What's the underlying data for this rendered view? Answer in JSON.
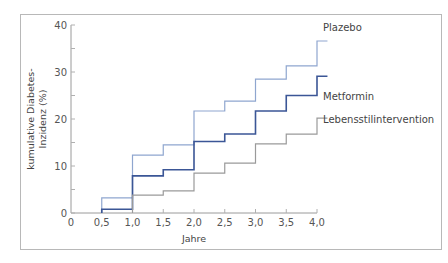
{
  "chart_data": {
    "type": "line",
    "step": true,
    "title": "",
    "xlabel": "Jahre",
    "ylabel_lines": [
      "kumulative Diabetes-",
      "Inzidenz (%)"
    ],
    "ylabel": "kumulative Diabetes-Inzidenz (%)",
    "xlim": [
      0,
      4.0
    ],
    "ylim": [
      0,
      40
    ],
    "x_ticks": [
      0,
      0.5,
      1.0,
      1.5,
      2.0,
      2.5,
      3.0,
      3.5,
      4.0
    ],
    "x_tick_labels": [
      "0",
      "0,5",
      "1,0",
      "1,5",
      "2,0",
      "2,5",
      "3,0",
      "3,5",
      "4,0"
    ],
    "y_ticks": [
      0,
      10,
      20,
      30,
      40
    ],
    "y_tick_labels": [
      "0",
      "10",
      "20",
      "30",
      "40"
    ],
    "grid": false,
    "legend": "inline labels at right end of lines",
    "x": [
      0.5,
      1.0,
      1.5,
      2.0,
      2.5,
      3.0,
      3.5,
      4.0
    ],
    "series": [
      {
        "name": "Plazebo",
        "color": "#8fa6cf",
        "values": [
          3.2,
          12.3,
          14.5,
          21.7,
          23.8,
          28.5,
          31.3,
          36.6
        ]
      },
      {
        "name": "Metformin",
        "color": "#3b5696",
        "values": [
          0.8,
          7.9,
          9.2,
          15.2,
          16.8,
          21.7,
          25.0,
          29.1
        ]
      },
      {
        "name": "Lebensstilintervention",
        "color": "#9a9a9a",
        "values": [
          0.0,
          3.8,
          4.7,
          8.5,
          10.6,
          14.7,
          16.8,
          20.2
        ]
      }
    ]
  }
}
